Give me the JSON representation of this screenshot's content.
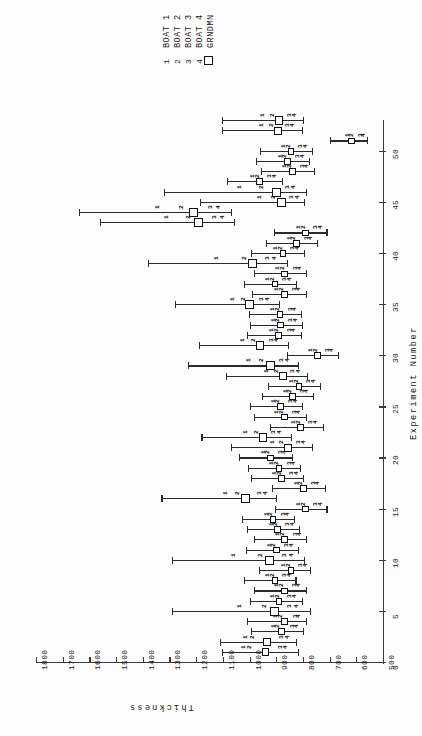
{
  "legend": {
    "names": [
      "BOAT 1",
      "BOAT 2",
      "BOAT 3",
      "BOAT 4",
      "GRNDMN"
    ],
    "symbols": [
      "1",
      "2",
      "3",
      "4",
      "square"
    ]
  },
  "chart_data": {
    "type": "scatter",
    "title": "",
    "xlabel": "Experiment Number",
    "ylabel": "Thickness",
    "orientation": "rotated-90",
    "grid": false,
    "legend_position": "top",
    "xlim": [
      0,
      53
    ],
    "ylim": [
      500,
      1800
    ],
    "xticks": [
      0,
      5,
      10,
      15,
      20,
      25,
      30,
      35,
      40,
      45,
      50
    ],
    "yticks": [
      500,
      600,
      700,
      800,
      900,
      1000,
      1100,
      1200,
      1300,
      1400,
      1500,
      1600,
      1700,
      1800
    ],
    "series": [
      {
        "name": "BOAT 1",
        "symbol": "1"
      },
      {
        "name": "BOAT 2",
        "symbol": "2"
      },
      {
        "name": "BOAT 3",
        "symbol": "3"
      },
      {
        "name": "BOAT 4",
        "symbol": "4"
      },
      {
        "name": "GRNDMN",
        "symbol": "square"
      }
    ],
    "experiments": [
      {
        "x": 1,
        "grandmean": 940,
        "ci": [
          1105,
          820
        ],
        "boats": [
          1045,
          1020,
          905,
          885
        ]
      },
      {
        "x": 2,
        "grandmean": 935,
        "ci": [
          1110,
          825
        ],
        "boats": [
          1035,
          1010,
          900,
          880
        ]
      },
      {
        "x": 3,
        "grandmean": 880,
        "ci": [
          995,
          800
        ],
        "boats": [
          930,
          915,
          860,
          845
        ]
      },
      {
        "x": 4,
        "grandmean": 870,
        "ci": [
          1010,
          790
        ],
        "boats": [
          925,
          905,
          850,
          838
        ]
      },
      {
        "x": 5,
        "grandmean": 905,
        "ci": [
          1290,
          775
        ],
        "boats": [
          1060,
          965,
          870,
          845
        ]
      },
      {
        "x": 6,
        "grandmean": 890,
        "ci": [
          1000,
          805
        ],
        "boats": [
          935,
          915,
          870,
          852
        ]
      },
      {
        "x": 7,
        "grandmean": 870,
        "ci": [
          985,
          790
        ],
        "boats": [
          918,
          900,
          852,
          836
        ]
      },
      {
        "x": 8,
        "grandmean": 905,
        "ci": [
          1020,
          828
        ],
        "boats": [
          952,
          935,
          888,
          870
        ]
      },
      {
        "x": 9,
        "grandmean": 845,
        "ci": [
          965,
          772
        ],
        "boats": [
          892,
          876,
          830,
          812
        ]
      },
      {
        "x": 10,
        "grandmean": 925,
        "ci": [
          1290,
          795
        ],
        "boats": [
          1080,
          980,
          888,
          865
        ]
      },
      {
        "x": 11,
        "grandmean": 900,
        "ci": [
          1015,
          820
        ],
        "boats": [
          946,
          930,
          882,
          865
        ]
      },
      {
        "x": 12,
        "grandmean": 868,
        "ci": [
          985,
          788
        ],
        "boats": [
          915,
          898,
          850,
          834
        ]
      },
      {
        "x": 13,
        "grandmean": 895,
        "ci": [
          1008,
          815
        ],
        "boats": [
          940,
          925,
          878,
          860
        ]
      },
      {
        "x": 14,
        "grandmean": 912,
        "ci": [
          1030,
          832
        ],
        "boats": [
          958,
          942,
          895,
          878
        ]
      },
      {
        "x": 15,
        "grandmean": 790,
        "ci": [
          905,
          712
        ],
        "boats": [
          838,
          820,
          775,
          756
        ]
      },
      {
        "x": 16,
        "grandmean": 1015,
        "ci": [
          1330,
          900
        ],
        "boats": [
          1110,
          1065,
          985,
          960
        ]
      },
      {
        "x": 17,
        "grandmean": 798,
        "ci": [
          915,
          718
        ],
        "boats": [
          845,
          828,
          782,
          765
        ]
      },
      {
        "x": 18,
        "grandmean": 880,
        "ci": [
          995,
          800
        ],
        "boats": [
          928,
          910,
          862,
          845
        ]
      },
      {
        "x": 19,
        "grandmean": 890,
        "ci": [
          1005,
          810
        ],
        "boats": [
          938,
          920,
          872,
          855
        ]
      },
      {
        "x": 20,
        "grandmean": 922,
        "ci": [
          1040,
          840
        ],
        "boats": [
          968,
          952,
          905,
          888
        ]
      },
      {
        "x": 21,
        "grandmean": 855,
        "ci": [
          1070,
          765
        ],
        "boats": [
          935,
          900,
          838,
          818
        ]
      },
      {
        "x": 22,
        "grandmean": 950,
        "ci": [
          1180,
          845
        ],
        "boats": [
          1035,
          995,
          930,
          908
        ]
      },
      {
        "x": 23,
        "grandmean": 808,
        "ci": [
          925,
          726
        ],
        "boats": [
          856,
          838,
          792,
          774
        ]
      },
      {
        "x": 24,
        "grandmean": 870,
        "ci": [
          985,
          790
        ],
        "boats": [
          918,
          900,
          852,
          836
        ]
      },
      {
        "x": 25,
        "grandmean": 885,
        "ci": [
          1000,
          805
        ],
        "boats": [
          932,
          915,
          868,
          850
        ]
      },
      {
        "x": 26,
        "grandmean": 840,
        "ci": [
          955,
          762
        ],
        "boats": [
          886,
          870,
          824,
          806
        ]
      },
      {
        "x": 27,
        "grandmean": 815,
        "ci": [
          930,
          735
        ],
        "boats": [
          862,
          845,
          798,
          782
        ]
      },
      {
        "x": 28,
        "grandmean": 875,
        "ci": [
          1090,
          785
        ],
        "boats": [
          958,
          920,
          858,
          838
        ]
      },
      {
        "x": 29,
        "grandmean": 922,
        "ci": [
          1230,
          820
        ],
        "boats": [
          1025,
          975,
          902,
          880
        ]
      },
      {
        "x": 30,
        "grandmean": 745,
        "ci": [
          860,
          668
        ],
        "boats": [
          792,
          775,
          728,
          712
        ]
      },
      {
        "x": 31,
        "grandmean": 960,
        "ci": [
          1190,
          855
        ],
        "boats": [
          1048,
          1005,
          940,
          918
        ]
      },
      {
        "x": 32,
        "grandmean": 890,
        "ci": [
          1008,
          808
        ],
        "boats": [
          938,
          920,
          872,
          855
        ]
      },
      {
        "x": 33,
        "grandmean": 885,
        "ci": [
          1000,
          805
        ],
        "boats": [
          932,
          915,
          868,
          850
        ]
      },
      {
        "x": 34,
        "grandmean": 886,
        "ci": [
          1002,
          806
        ],
        "boats": [
          934,
          916,
          869,
          852
        ]
      },
      {
        "x": 35,
        "grandmean": 1000,
        "ci": [
          1280,
          890
        ],
        "boats": [
          1085,
          1045,
          975,
          952
        ]
      },
      {
        "x": 36,
        "grandmean": 870,
        "ci": [
          990,
          790
        ],
        "boats": [
          918,
          900,
          852,
          836
        ]
      },
      {
        "x": 37,
        "grandmean": 905,
        "ci": [
          1020,
          825
        ],
        "boats": [
          952,
          935,
          888,
          870
        ]
      },
      {
        "x": 38,
        "grandmean": 868,
        "ci": [
          985,
          788
        ],
        "boats": [
          915,
          898,
          850,
          834
        ]
      },
      {
        "x": 39,
        "grandmean": 990,
        "ci": [
          1380,
          860
        ],
        "boats": [
          1145,
          1040,
          952,
          928
        ]
      },
      {
        "x": 40,
        "grandmean": 875,
        "ci": [
          995,
          795
        ],
        "boats": [
          922,
          905,
          858,
          840
        ]
      },
      {
        "x": 41,
        "grandmean": 825,
        "ci": [
          940,
          748
        ],
        "boats": [
          872,
          855,
          808,
          792
        ]
      },
      {
        "x": 42,
        "grandmean": 790,
        "ci": [
          908,
          712
        ],
        "boats": [
          838,
          820,
          775,
          756
        ]
      },
      {
        "x": 43,
        "grandmean": 1190,
        "ci": [
          1560,
          1058
        ],
        "boats": [
          1330,
          1250,
          1152,
          1122
        ]
      },
      {
        "x": 44,
        "grandmean": 1210,
        "ci": [
          1640,
          1070
        ],
        "boats": [
          1365,
          1275,
          1168,
          1138
        ]
      },
      {
        "x": 45,
        "grandmean": 880,
        "ci": [
          1185,
          795
        ],
        "boats": [
          985,
          932,
          862,
          842
        ]
      },
      {
        "x": 46,
        "grandmean": 900,
        "ci": [
          1320,
          790
        ],
        "boats": [
          1060,
          975,
          878,
          855
        ]
      },
      {
        "x": 47,
        "grandmean": 962,
        "ci": [
          1085,
          878
        ],
        "boats": [
          1010,
          992,
          944,
          926
        ]
      },
      {
        "x": 48,
        "grandmean": 840,
        "ci": [
          958,
          760
        ],
        "boats": [
          888,
          870,
          824,
          806
        ]
      },
      {
        "x": 49,
        "grandmean": 858,
        "ci": [
          975,
          778
        ],
        "boats": [
          905,
          888,
          840,
          824
        ]
      },
      {
        "x": 50,
        "grandmean": 845,
        "ci": [
          962,
          765
        ],
        "boats": [
          892,
          875,
          828,
          810
        ]
      },
      {
        "x": 51,
        "grandmean": 618,
        "ci": [
          700,
          560
        ],
        "boats": [
          652,
          640,
          605,
          592
        ]
      },
      {
        "x": 52,
        "grandmean": 895,
        "ci": [
          1105,
          805
        ],
        "boats": [
          975,
          940,
          878,
          858
        ]
      },
      {
        "x": 53,
        "grandmean": 890,
        "ci": [
          1105,
          800
        ],
        "boats": [
          972,
          936,
          872,
          852
        ]
      }
    ]
  }
}
